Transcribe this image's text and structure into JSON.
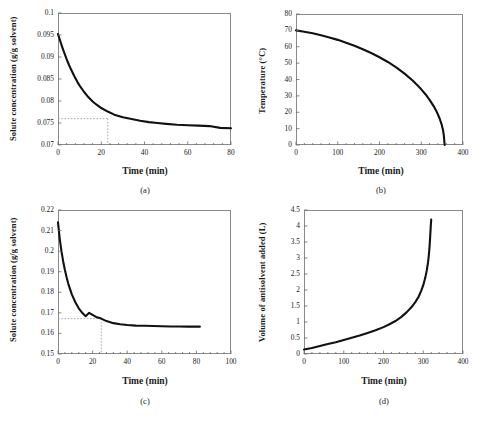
{
  "figure": {
    "background": "#ffffff",
    "curve_color": "#111111",
    "frame_color": "#8a8a8a",
    "guide_color": "#9a9a9a"
  },
  "chart_data": [
    {
      "id": "a",
      "type": "line",
      "caption": "(a)",
      "title": "",
      "xlabel": "Time (min)",
      "ylabel": "Solute concentration (g/g solvent)",
      "xlim": [
        0,
        80
      ],
      "ylim": [
        0.07,
        0.1
      ],
      "xticks": [
        0,
        20,
        40,
        60,
        80
      ],
      "yticks": [
        0.07,
        0.075,
        0.08,
        0.085,
        0.09,
        0.095,
        0.1
      ],
      "ytick_labels": [
        "0.07",
        "0.075",
        "0.08",
        "0.085",
        "0.09",
        "0.095",
        "0.1"
      ],
      "xtick_labels": [
        "0",
        "20",
        "40",
        "60",
        "80"
      ],
      "minor_xticks": 4,
      "grid": false,
      "legend": "none",
      "guides": {
        "x": 23,
        "y": 0.076,
        "style": "dotted"
      },
      "x": [
        0,
        1,
        2,
        3,
        4,
        5,
        6,
        7,
        8,
        9,
        10,
        12,
        14,
        16,
        18,
        20,
        23,
        26,
        30,
        34,
        38,
        42,
        46,
        50,
        55,
        60,
        65,
        70,
        75,
        80
      ],
      "y": [
        0.0952,
        0.0937,
        0.0922,
        0.0908,
        0.0895,
        0.0883,
        0.0872,
        0.0862,
        0.0852,
        0.0843,
        0.0835,
        0.0821,
        0.0809,
        0.0799,
        0.0791,
        0.0784,
        0.0776,
        0.0769,
        0.0763,
        0.0759,
        0.0755,
        0.0752,
        0.075,
        0.0748,
        0.0746,
        0.0745,
        0.0744,
        0.0743,
        0.0739,
        0.0738
      ]
    },
    {
      "id": "b",
      "type": "line",
      "caption": "(b)",
      "title": "",
      "xlabel": "Time (min)",
      "ylabel": "Temperature (°C)",
      "xlim": [
        0,
        400
      ],
      "ylim": [
        0,
        80
      ],
      "xticks": [
        0,
        100,
        200,
        300,
        400
      ],
      "yticks": [
        0,
        10,
        20,
        30,
        40,
        50,
        60,
        70,
        80
      ],
      "ytick_labels": [
        "0",
        "10",
        "20",
        "30",
        "40",
        "50",
        "60",
        "70",
        "80"
      ],
      "xtick_labels": [
        "0",
        "100",
        "200",
        "300",
        "400"
      ],
      "minor_xticks": 4,
      "grid": false,
      "legend": "none",
      "x": [
        0,
        20,
        40,
        60,
        80,
        100,
        120,
        140,
        160,
        180,
        200,
        220,
        240,
        260,
        280,
        290,
        300,
        310,
        320,
        330,
        338,
        344,
        349,
        352,
        354,
        356
      ],
      "y": [
        70.0,
        69.2,
        68.2,
        67.0,
        65.7,
        64.2,
        62.5,
        60.6,
        58.5,
        56.2,
        53.6,
        50.7,
        47.4,
        43.6,
        39.2,
        36.7,
        34.0,
        31.0,
        27.6,
        23.6,
        19.8,
        16.2,
        12.4,
        9.2,
        6.0,
        0.0
      ]
    },
    {
      "id": "c",
      "type": "line",
      "caption": "(c)",
      "title": "",
      "xlabel": "Time (min)",
      "ylabel": "Solute concentration (g/g solvent)",
      "xlim": [
        0,
        100
      ],
      "ylim": [
        0.15,
        0.22
      ],
      "xticks": [
        0,
        20,
        40,
        60,
        80,
        100
      ],
      "yticks": [
        0.15,
        0.16,
        0.17,
        0.18,
        0.19,
        0.2,
        0.21,
        0.22
      ],
      "ytick_labels": [
        "0.15",
        "0.16",
        "0.17",
        "0.18",
        "0.19",
        "0.2",
        "0.21",
        "0.22"
      ],
      "xtick_labels": [
        "0",
        "20",
        "40",
        "60",
        "80",
        "100"
      ],
      "minor_xticks": 4,
      "grid": false,
      "legend": "none",
      "guides": {
        "x": 25,
        "y": 0.1672,
        "style": "dotted"
      },
      "x": [
        0,
        1,
        2,
        3,
        4,
        5,
        6,
        8,
        10,
        12,
        14,
        16,
        18,
        20,
        22,
        25,
        28,
        32,
        36,
        40,
        45,
        50,
        55,
        60,
        65,
        70,
        75,
        80,
        82
      ],
      "y": [
        0.214,
        0.206,
        0.2,
        0.195,
        0.1908,
        0.1872,
        0.184,
        0.179,
        0.1752,
        0.1722,
        0.17,
        0.1684,
        0.17,
        0.169,
        0.168,
        0.1672,
        0.166,
        0.165,
        0.1645,
        0.1641,
        0.1638,
        0.1637,
        0.1636,
        0.1635,
        0.1634,
        0.1634,
        0.1633,
        0.1633,
        0.1633
      ]
    },
    {
      "id": "d",
      "type": "line",
      "caption": "(d)",
      "title": "",
      "xlabel": "Time (min)",
      "ylabel": "Volume of antisolvent added (L)",
      "xlim": [
        0,
        400
      ],
      "ylim": [
        0,
        4.5
      ],
      "xticks": [
        0,
        100,
        200,
        300,
        400
      ],
      "yticks": [
        0,
        0.5,
        1,
        1.5,
        2,
        2.5,
        3,
        3.5,
        4,
        4.5
      ],
      "ytick_labels": [
        "0",
        "0.5",
        "1",
        "1.5",
        "2",
        "2.5",
        "3",
        "3.5",
        "4",
        "4.5"
      ],
      "xtick_labels": [
        "0",
        "100",
        "200",
        "300",
        "400"
      ],
      "minor_xticks": 4,
      "grid": false,
      "legend": "none",
      "x": [
        0,
        20,
        40,
        60,
        80,
        100,
        120,
        140,
        160,
        180,
        200,
        215,
        230,
        245,
        258,
        270,
        280,
        288,
        295,
        300,
        305,
        309,
        312,
        314,
        316,
        317,
        318,
        319,
        320
      ],
      "y": [
        0.14,
        0.19,
        0.25,
        0.31,
        0.37,
        0.44,
        0.51,
        0.58,
        0.66,
        0.74,
        0.84,
        0.93,
        1.03,
        1.16,
        1.3,
        1.46,
        1.62,
        1.78,
        1.98,
        2.15,
        2.38,
        2.62,
        2.86,
        3.08,
        3.38,
        3.58,
        3.8,
        4.02,
        4.2
      ]
    }
  ]
}
